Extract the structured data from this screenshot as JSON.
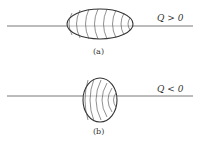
{
  "panels": [
    {
      "id": "a",
      "caption": "(a)",
      "condition": "Q > 0",
      "shape": "prolate ellipsoid (elongated along axis)"
    },
    {
      "id": "b",
      "caption": "(b)",
      "condition": "Q < 0",
      "shape": "oblate ellipsoid (flattened along axis)"
    }
  ],
  "colors": {
    "stroke": "#333333",
    "axis": "#555555",
    "background": "#ffffff"
  }
}
